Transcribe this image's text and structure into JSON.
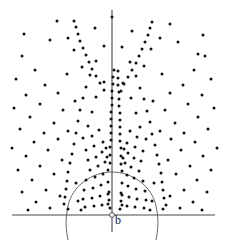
{
  "figure": {
    "width": 228,
    "height": 242,
    "background_color": "#ffffff",
    "dot_color": "#111111",
    "axis_color": "#4a4a4a",
    "arc_color": "#555555"
  },
  "labels": {
    "origin_label": "b"
  },
  "chart_data": {
    "type": "scatter",
    "title": "",
    "xlabel": "",
    "ylabel": "",
    "grid": false,
    "legend": null,
    "annotations": [
      {
        "text": "b",
        "x": 115,
        "y": 224
      }
    ],
    "axes": [
      {
        "name": "vertical-axis",
        "x1": 112,
        "y1": 10,
        "x2": 112,
        "y2": 232
      },
      {
        "name": "horizontal-axis",
        "x1": 12,
        "y1": 215,
        "x2": 215,
        "y2": 215
      }
    ],
    "origin_marker": {
      "cx": 112,
      "cy": 215,
      "r": 2.4
    },
    "arcs": [
      {
        "name": "left-arc",
        "d": "M 112 172 C 92 172 72 186 68 206 C 65 220 66 230 68 240"
      },
      {
        "name": "right-arc",
        "d": "M 112 172 C 132 172 152 186 156 206 C 159 220 158 230 156 240"
      }
    ],
    "dot_radius": 1.5,
    "points": [
      [
        57,
        21
      ],
      [
        112,
        17
      ],
      [
        170,
        24
      ],
      [
        24,
        34
      ],
      [
        68,
        38
      ],
      [
        95,
        28
      ],
      [
        132,
        31
      ],
      [
        160,
        38
      ],
      [
        203,
        35
      ],
      [
        74,
        50
      ],
      [
        151,
        49
      ],
      [
        198,
        54
      ],
      [
        22,
        56
      ],
      [
        50,
        40
      ],
      [
        178,
        42
      ],
      [
        205,
        56
      ],
      [
        104,
        46
      ],
      [
        122,
        47
      ],
      [
        96,
        61
      ],
      [
        130,
        62
      ],
      [
        16,
        79
      ],
      [
        35,
        70
      ],
      [
        45,
        85
      ],
      [
        67,
        74
      ],
      [
        82,
        67
      ],
      [
        144,
        66
      ],
      [
        162,
        74
      ],
      [
        183,
        85
      ],
      [
        194,
        70
      ],
      [
        211,
        79
      ],
      [
        90,
        75
      ],
      [
        136,
        76
      ],
      [
        86,
        87
      ],
      [
        140,
        88
      ],
      [
        26,
        95
      ],
      [
        58,
        93
      ],
      [
        104,
        82
      ],
      [
        123,
        83
      ],
      [
        170,
        93
      ],
      [
        202,
        95
      ],
      [
        83,
        98
      ],
      [
        144,
        99
      ],
      [
        14,
        108
      ],
      [
        40,
        104
      ],
      [
        63,
        110
      ],
      [
        75,
        101
      ],
      [
        153,
        101
      ],
      [
        165,
        110
      ],
      [
        188,
        104
      ],
      [
        214,
        108
      ],
      [
        80,
        110
      ],
      [
        147,
        111
      ],
      [
        30,
        117
      ],
      [
        54,
        123
      ],
      [
        96,
        97
      ],
      [
        131,
        98
      ],
      [
        175,
        123
      ],
      [
        198,
        117
      ],
      [
        78,
        121
      ],
      [
        150,
        122
      ],
      [
        20,
        129
      ],
      [
        44,
        133
      ],
      [
        68,
        131
      ],
      [
        92,
        112
      ],
      [
        136,
        113
      ],
      [
        160,
        131
      ],
      [
        184,
        133
      ],
      [
        208,
        129
      ],
      [
        76,
        133
      ],
      [
        152,
        134
      ],
      [
        34,
        142
      ],
      [
        58,
        139
      ],
      [
        88,
        126
      ],
      [
        140,
        127
      ],
      [
        171,
        139
      ],
      [
        195,
        142
      ],
      [
        74,
        144
      ],
      [
        155,
        145
      ],
      [
        12,
        148
      ],
      [
        48,
        150
      ],
      [
        83,
        138
      ],
      [
        146,
        139
      ],
      [
        181,
        150
      ],
      [
        217,
        148
      ],
      [
        72,
        154
      ],
      [
        157,
        155
      ],
      [
        26,
        156
      ],
      [
        62,
        160
      ],
      [
        92,
        136
      ],
      [
        137,
        137
      ],
      [
        168,
        160
      ],
      [
        203,
        156
      ],
      [
        70,
        163
      ],
      [
        159,
        164
      ],
      [
        40,
        166
      ],
      [
        99,
        130
      ],
      [
        130,
        131
      ],
      [
        190,
        166
      ],
      [
        68,
        172
      ],
      [
        161,
        173
      ],
      [
        18,
        170
      ],
      [
        54,
        174
      ],
      [
        86,
        150
      ],
      [
        143,
        151
      ],
      [
        176,
        174
      ],
      [
        211,
        170
      ],
      [
        67,
        181
      ],
      [
        162,
        182
      ],
      [
        32,
        180
      ],
      [
        76,
        183
      ],
      [
        94,
        146
      ],
      [
        135,
        147
      ],
      [
        154,
        183
      ],
      [
        197,
        180
      ],
      [
        66,
        189
      ],
      [
        163,
        190
      ],
      [
        46,
        190
      ],
      [
        103,
        142
      ],
      [
        127,
        143
      ],
      [
        184,
        190
      ],
      [
        65,
        197
      ],
      [
        164,
        198
      ],
      [
        22,
        192
      ],
      [
        60,
        196
      ],
      [
        88,
        160
      ],
      [
        141,
        161
      ],
      [
        170,
        196
      ],
      [
        207,
        192
      ],
      [
        64,
        204
      ],
      [
        166,
        205
      ],
      [
        36,
        202
      ],
      [
        78,
        201
      ],
      [
        96,
        157
      ],
      [
        134,
        158
      ],
      [
        152,
        201
      ],
      [
        193,
        202
      ],
      [
        102,
        152
      ],
      [
        128,
        153
      ],
      [
        50,
        208
      ],
      [
        81,
        210
      ],
      [
        150,
        210
      ],
      [
        180,
        208
      ],
      [
        106,
        148
      ],
      [
        124,
        149
      ],
      [
        28,
        210
      ],
      [
        68,
        209
      ],
      [
        163,
        209
      ],
      [
        202,
        210
      ],
      [
        90,
        170
      ],
      [
        139,
        171
      ],
      [
        98,
        166
      ],
      [
        131,
        167
      ],
      [
        105,
        162
      ],
      [
        125,
        163
      ],
      [
        107,
        157
      ],
      [
        123,
        158
      ],
      [
        86,
        180
      ],
      [
        143,
        181
      ],
      [
        95,
        177
      ],
      [
        134,
        178
      ],
      [
        103,
        174
      ],
      [
        127,
        175
      ],
      [
        108,
        170
      ],
      [
        122,
        171
      ],
      [
        84,
        190
      ],
      [
        145,
        191
      ],
      [
        93,
        188
      ],
      [
        136,
        189
      ],
      [
        101,
        185
      ],
      [
        128,
        186
      ],
      [
        108,
        182
      ],
      [
        122,
        183
      ],
      [
        83,
        199
      ],
      [
        146,
        200
      ],
      [
        92,
        198
      ],
      [
        137,
        199
      ],
      [
        100,
        196
      ],
      [
        129,
        197
      ],
      [
        108,
        194
      ],
      [
        122,
        195
      ],
      [
        85,
        207
      ],
      [
        144,
        208
      ],
      [
        94,
        206
      ],
      [
        135,
        207
      ],
      [
        102,
        205
      ],
      [
        127,
        206
      ],
      [
        108,
        204
      ],
      [
        122,
        205
      ],
      [
        109,
        192
      ],
      [
        121,
        193
      ],
      [
        109,
        200
      ],
      [
        121,
        201
      ],
      [
        110,
        208
      ],
      [
        120,
        209
      ],
      [
        110,
        163
      ],
      [
        121,
        164
      ],
      [
        110,
        155
      ],
      [
        121,
        156
      ],
      [
        110,
        147
      ],
      [
        121,
        148
      ],
      [
        111,
        140
      ],
      [
        120,
        141
      ],
      [
        111,
        133
      ],
      [
        120,
        134
      ],
      [
        111,
        126
      ],
      [
        120,
        127
      ],
      [
        111,
        119
      ],
      [
        120,
        120
      ],
      [
        111,
        112
      ],
      [
        120,
        113
      ],
      [
        112,
        105
      ],
      [
        119,
        106
      ],
      [
        112,
        98
      ],
      [
        119,
        99
      ],
      [
        112,
        91
      ],
      [
        119,
        92
      ],
      [
        113,
        84
      ],
      [
        118,
        85
      ],
      [
        113,
        77
      ],
      [
        118,
        78
      ],
      [
        114,
        70
      ],
      [
        118,
        71
      ],
      [
        104,
        90
      ],
      [
        121,
        91
      ],
      [
        100,
        83
      ],
      [
        124,
        84
      ],
      [
        96,
        76
      ],
      [
        128,
        77
      ],
      [
        92,
        69
      ],
      [
        132,
        70
      ],
      [
        89,
        62
      ],
      [
        136,
        63
      ],
      [
        86,
        55
      ],
      [
        139,
        56
      ],
      [
        83,
        48
      ],
      [
        142,
        49
      ],
      [
        80,
        41
      ],
      [
        145,
        42
      ],
      [
        78,
        34
      ],
      [
        148,
        35
      ],
      [
        76,
        27
      ],
      [
        150,
        28
      ],
      [
        74,
        21
      ],
      [
        152,
        22
      ]
    ]
  }
}
